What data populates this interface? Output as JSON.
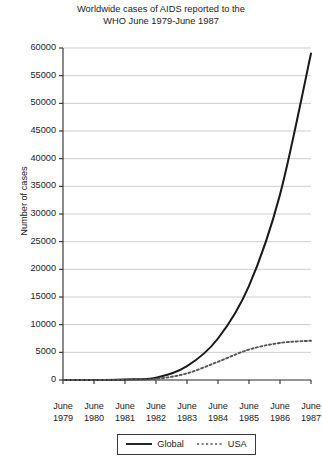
{
  "chart_data": {
    "type": "line",
    "title": "Worldwide cases of AIDS reported to the WHO June 1979-June 1987",
    "title_lines": [
      "Worldwide cases of AIDS reported to the",
      "WHO June 1979-June 1987"
    ],
    "xlabel": "",
    "ylabel": "Number of cases",
    "ylim": [
      0,
      60000
    ],
    "ytick_step": 5000,
    "grid": true,
    "grid_axis": "y",
    "legend_position": "bottom-center",
    "categories": [
      "June 1979",
      "June 1980",
      "June 1981",
      "June 1982",
      "June 1983",
      "June 1984",
      "June 1985",
      "June 1986",
      "June 1987"
    ],
    "x_tick_months": [
      "June",
      "June",
      "June",
      "June",
      "June",
      "June",
      "June",
      "June",
      "June"
    ],
    "x_tick_years": [
      "1979",
      "1980",
      "1981",
      "1982",
      "1983",
      "1984",
      "1985",
      "1986",
      "1987"
    ],
    "ytick_labels": [
      "60000",
      "55000",
      "50000",
      "45000",
      "40000",
      "35000",
      "30000",
      "25000",
      "20000",
      "15000",
      "10000",
      "5000",
      "0"
    ],
    "ytick_values": [
      60000,
      55000,
      50000,
      45000,
      40000,
      35000,
      30000,
      25000,
      20000,
      15000,
      10000,
      5000,
      0
    ],
    "series": [
      {
        "name": "Global",
        "style": "solid",
        "color": "#1a1a1a",
        "values": [
          0,
          0,
          100,
          400,
          2500,
          7500,
          17000,
          33500,
          59000
        ]
      },
      {
        "name": "USA",
        "style": "dashed",
        "color": "#555555",
        "values": [
          0,
          0,
          50,
          200,
          1200,
          3300,
          5500,
          6700,
          7100
        ]
      }
    ]
  },
  "legend": {
    "items": [
      {
        "label": "Global",
        "style": "solid"
      },
      {
        "label": "USA",
        "style": "dashed"
      }
    ]
  }
}
